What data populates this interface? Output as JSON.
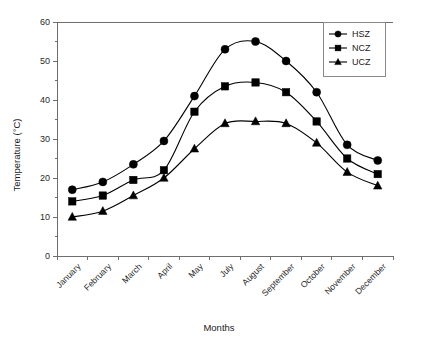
{
  "chart_data": {
    "type": "line",
    "title": "",
    "xlabel": "Months",
    "ylabel": "Temperature (°C)",
    "categories": [
      "January",
      "February",
      "March",
      "April",
      "May",
      "July",
      "August",
      "September",
      "October",
      "November",
      "December"
    ],
    "ylim": [
      0,
      60
    ],
    "yticks": [
      0,
      10,
      20,
      30,
      40,
      50,
      60
    ],
    "ytick_labels": [
      "0",
      "10",
      "20",
      "30",
      "40",
      "50",
      "60"
    ],
    "grid": false,
    "legend_position": "top-right",
    "series": [
      {
        "name": "HSZ",
        "marker": "circle",
        "color": "#000000",
        "values": [
          17.0,
          19.0,
          23.5,
          29.5,
          41.0,
          53.0,
          55.0,
          50.0,
          42.0,
          28.5,
          24.5
        ]
      },
      {
        "name": "NCZ",
        "marker": "square",
        "color": "#000000",
        "values": [
          14.0,
          15.5,
          19.5,
          22.0,
          37.0,
          43.5,
          44.5,
          42.0,
          34.5,
          25.0,
          21.0
        ]
      },
      {
        "name": "UCZ",
        "marker": "triangle",
        "color": "#000000",
        "values": [
          10.0,
          11.5,
          15.5,
          20.0,
          27.5,
          34.0,
          34.5,
          34.0,
          29.0,
          21.5,
          18.0
        ]
      }
    ]
  },
  "axes": {
    "y_axis_label": "Temperature (°C)",
    "x_axis_label": "Months"
  },
  "legend": {
    "entries": [
      {
        "label": "HSZ",
        "marker": "circle"
      },
      {
        "label": "NCZ",
        "marker": "square"
      },
      {
        "label": "UCZ",
        "marker": "triangle"
      }
    ]
  }
}
